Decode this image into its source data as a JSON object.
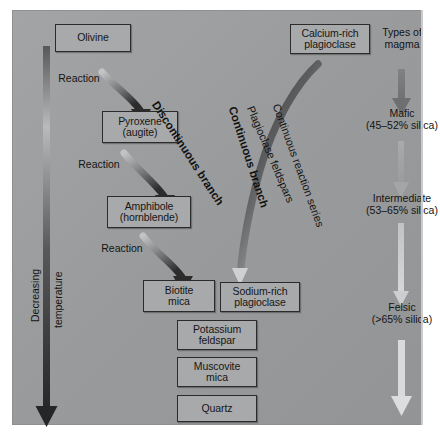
{
  "diagram": {
    "background_color": "#9a9b9c",
    "box_fill_color": "#a8a9aa",
    "box_border_color": "#2b2b2b",
    "dark_arrow_color": "#2f2f2f",
    "light_arrow_color": "#cfd0d1"
  },
  "discontinuous": {
    "branch_label": "Discontinuous branch",
    "boxes": [
      {
        "label": "Olivine"
      },
      {
        "label": "Pyroxene\n(augite)"
      },
      {
        "label": "Amphibole\n(hornblende)"
      },
      {
        "label": "Biotite\nmica"
      }
    ],
    "reaction_labels": [
      "Reaction",
      "Reaction",
      "Reaction"
    ]
  },
  "continuous": {
    "branch_label": "Continuous branch",
    "sub_label_1": "Plagioclase feldspars",
    "sub_label_2": "Continuous reaction series",
    "boxes": [
      {
        "label": "Calcium-rich\nplagioclase"
      },
      {
        "label": "Sodium-rich\nplagioclase"
      }
    ]
  },
  "common": {
    "boxes": [
      {
        "label": "Potassium\nfeldspar"
      },
      {
        "label": "Muscovite\nmica"
      },
      {
        "label": "Quartz"
      }
    ]
  },
  "temperature_axis": {
    "label": "Decreasing",
    "label2": "temperature"
  },
  "magma": {
    "header": "Types of\nmagma",
    "types": [
      {
        "name": "Mafic",
        "silica": "(45–52% silica)"
      },
      {
        "name": "Intermediate",
        "silica": "(53–65% silica)"
      },
      {
        "name": "Felsic",
        "silica": "(>65% silica)"
      }
    ]
  }
}
